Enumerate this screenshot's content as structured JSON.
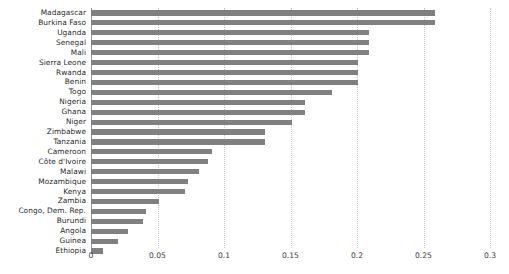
{
  "chart": {
    "type": "barh",
    "title": "",
    "xlabel": "",
    "ylabel": "",
    "x_axis": {
      "min": 0,
      "max": 0.3,
      "ticks": [
        0,
        0.05,
        0.1,
        0.15,
        0.2,
        0.25,
        0.3
      ],
      "tick_labels": [
        "0",
        "0.05",
        "0.1",
        "0.15",
        "0.2",
        "0.25",
        "0.3"
      ]
    },
    "grid": "vertical-dotted",
    "legend": "none",
    "bar_color": "#808080",
    "grid_color": "#c9c9c9",
    "axis_color": "#8f8f8f",
    "label_color": "#2b2b2b"
  },
  "chart_data": {
    "type": "bar",
    "orientation": "horizontal",
    "title": "",
    "xlabel": "",
    "ylabel": "",
    "xlim": [
      0,
      0.3
    ],
    "grid": true,
    "legend_position": "none",
    "categories": [
      "Madagascar",
      "Burkina Faso",
      "Uganda",
      "Senegal",
      "Mali",
      "Sierra Leone",
      "Rwanda",
      "Benin",
      "Togo",
      "Nigeria",
      "Ghana",
      "Niger",
      "Zimbabwe",
      "Tanzania",
      "Cameroon",
      "Côte d'Ivoire",
      "Malawi",
      "Mozambique",
      "Kenya",
      "Zambia",
      "Congo, Dem. Rep.",
      "Burundi",
      "Angola",
      "Guinea",
      "Ethiopia"
    ],
    "values": [
      0.259,
      0.259,
      0.209,
      0.209,
      0.209,
      0.201,
      0.201,
      0.201,
      0.181,
      0.161,
      0.161,
      0.151,
      0.131,
      0.131,
      0.091,
      0.088,
      0.081,
      0.073,
      0.071,
      0.051,
      0.041,
      0.039,
      0.028,
      0.02,
      0.009
    ]
  }
}
